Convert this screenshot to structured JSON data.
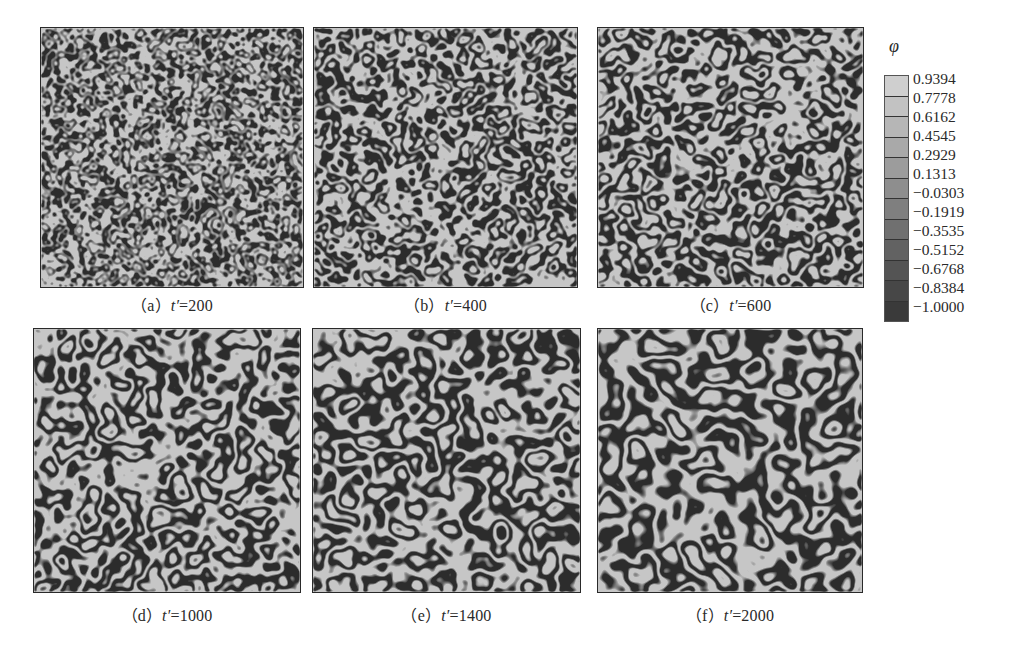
{
  "figure": {
    "panels": [
      {
        "id": "a",
        "label": "（a）",
        "tvar": "t′",
        "eq": "=200",
        "time": 200,
        "freq": 0.085,
        "seed": 3
      },
      {
        "id": "b",
        "label": "（b）",
        "tvar": "t′",
        "eq": "=400",
        "time": 400,
        "freq": 0.062,
        "seed": 7
      },
      {
        "id": "c",
        "label": "（c）",
        "tvar": "t′",
        "eq": "=600",
        "time": 600,
        "freq": 0.052,
        "seed": 11
      },
      {
        "id": "d",
        "label": "（d）",
        "tvar": "t′",
        "eq": "=1000",
        "time": 1000,
        "freq": 0.044,
        "seed": 17
      },
      {
        "id": "e",
        "label": "（e）",
        "tvar": "t′",
        "eq": "=1400",
        "time": 1400,
        "freq": 0.04,
        "seed": 23
      },
      {
        "id": "f",
        "label": "（f）",
        "tvar": "t′",
        "eq": "=2000",
        "time": 2000,
        "freq": 0.034,
        "seed": 29
      }
    ],
    "colorbar": {
      "symbol": "φ",
      "ticks": [
        "0.9394",
        "0.7778",
        "0.6162",
        "0.4545",
        "0.2929",
        "0.1313",
        "−0.0303",
        "−0.1919",
        "−0.3535",
        "−0.5152",
        "−0.6768",
        "−0.8384",
        "−1.0000"
      ],
      "colors": [
        "#cfcfcf",
        "#c2c2c2",
        "#b6b6b6",
        "#a9a9a9",
        "#9c9c9c",
        "#8e8e8e",
        "#7f7f7f",
        "#707070",
        "#626262",
        "#545454",
        "#474747",
        "#3a3a3a"
      ],
      "min": -1.0,
      "max": 0.9394
    },
    "colors": {
      "phase_light": "#c6c6c6",
      "phase_dark": "#2c2c2c",
      "border": "#2a2a2a"
    }
  }
}
